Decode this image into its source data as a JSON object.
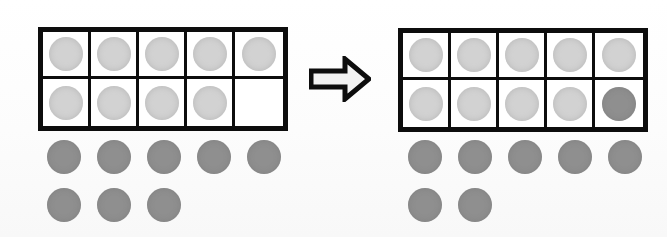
{
  "scene": {
    "title": "Ten-frame addition: making a ten",
    "background_color": "#fdfdfd",
    "frame_border_color": "#0d0d0d",
    "light_counter_color": "#d2d2d2",
    "dark_counter_color": "#8f8f8f"
  },
  "before": {
    "label": "before",
    "ten_frame": {
      "rows": 2,
      "columns": 5,
      "cells": [
        {
          "index": 1,
          "counter": "light"
        },
        {
          "index": 2,
          "counter": "light"
        },
        {
          "index": 3,
          "counter": "light"
        },
        {
          "index": 4,
          "counter": "light"
        },
        {
          "index": 5,
          "counter": "light"
        },
        {
          "index": 6,
          "counter": "light"
        },
        {
          "index": 7,
          "counter": "light"
        },
        {
          "index": 8,
          "counter": "light"
        },
        {
          "index": 9,
          "counter": "light"
        },
        {
          "index": 10,
          "counter": "empty"
        }
      ],
      "filled_count": 9,
      "empty_count": 1
    },
    "loose_counters": {
      "color": "dark",
      "rows": [
        5,
        3
      ],
      "total": 8
    }
  },
  "transition": {
    "icon": "right-arrow-icon",
    "direction": "right",
    "label": "becomes"
  },
  "after": {
    "label": "after",
    "ten_frame": {
      "rows": 2,
      "columns": 5,
      "cells": [
        {
          "index": 1,
          "counter": "light"
        },
        {
          "index": 2,
          "counter": "light"
        },
        {
          "index": 3,
          "counter": "light"
        },
        {
          "index": 4,
          "counter": "light"
        },
        {
          "index": 5,
          "counter": "light"
        },
        {
          "index": 6,
          "counter": "light"
        },
        {
          "index": 7,
          "counter": "light"
        },
        {
          "index": 8,
          "counter": "light"
        },
        {
          "index": 9,
          "counter": "light"
        },
        {
          "index": 10,
          "counter": "dark"
        }
      ],
      "filled_count": 10,
      "empty_count": 0
    },
    "loose_counters": {
      "color": "dark",
      "rows": [
        5,
        2
      ],
      "total": 7
    }
  }
}
